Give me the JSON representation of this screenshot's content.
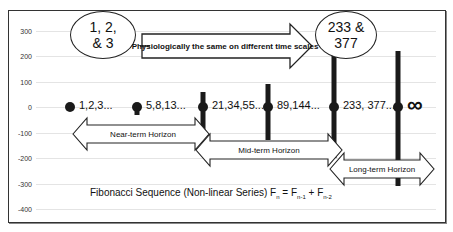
{
  "chart_data": {
    "type": "bar",
    "title": "Fibonacci Sequence (Non-linear Series) Fn = Fn-1 + Fn-2",
    "xlabel": "",
    "ylabel": "",
    "ylim": [
      -400,
      300
    ],
    "yticks": [
      300,
      200,
      100,
      0,
      -100,
      -200,
      -300,
      -400
    ],
    "grid": true,
    "categories": [
      "1,2,3...",
      "5,8,13...",
      "21,34,55...",
      "89,144...",
      "233, 377...",
      "∞"
    ],
    "series": [
      {
        "name": "high",
        "values": [
          10,
          15,
          60,
          90,
          230,
          220
        ]
      },
      {
        "name": "low",
        "values": [
          -10,
          -30,
          -110,
          -130,
          -200,
          -310
        ]
      },
      {
        "name": "marker",
        "values": [
          0,
          0,
          0,
          0,
          0,
          0
        ]
      }
    ],
    "annotations": [
      {
        "type": "ellipse",
        "text": "1, 2,\n& 3"
      },
      {
        "type": "ellipse",
        "text": "233 &\n377"
      },
      {
        "type": "arrow",
        "text": "Physiologically the same on different time scales"
      },
      {
        "type": "double-arrow",
        "text": "Near-term Horizon"
      },
      {
        "type": "double-arrow",
        "text": "Mid-term Horizon"
      },
      {
        "type": "double-arrow",
        "text": "Long-term Horizon"
      }
    ]
  },
  "labels": {
    "ellipse_left": "1, 2,\n& 3",
    "ellipse_right": "233 &\n377",
    "physio_arrow": "Physiologically the same on different time scales",
    "near": "Near-term Horizon",
    "mid": "Mid-term Horizon",
    "long": "Long-term Horizon",
    "title_main": "Fibonacci Sequence (Non-linear Series) F",
    "title_n": "n",
    "title_eq": " = F",
    "title_n1": "n-1",
    "title_plus": " + F",
    "title_n2": "n-2"
  }
}
